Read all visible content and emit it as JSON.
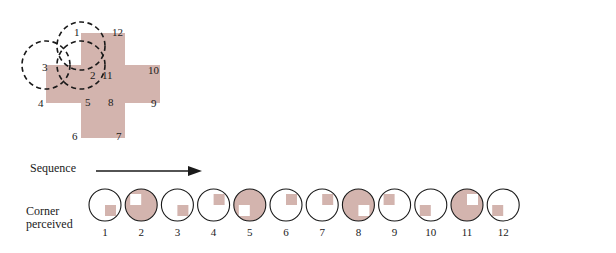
{
  "figure": {
    "kind": "corner-perception-diagram",
    "fill_color": "#d3b4ae",
    "stroke_color": "#1a1a1a",
    "background": "#ffffff"
  },
  "cross": {
    "name": "cross-polygon",
    "vertex_labels": [
      "1",
      "2",
      "3",
      "4",
      "5",
      "6",
      "7",
      "8",
      "9",
      "10",
      "11",
      "12"
    ],
    "dashed_circle_labels": [
      "1",
      "2",
      "3"
    ],
    "vertex_label_positions": [
      {
        "label": "1",
        "x": 74,
        "y": 26
      },
      {
        "label": "2",
        "x": 90,
        "y": 69
      },
      {
        "label": "3",
        "x": 42,
        "y": 61
      },
      {
        "label": "4",
        "x": 38,
        "y": 97
      },
      {
        "label": "5",
        "x": 85,
        "y": 96
      },
      {
        "label": "6",
        "x": 72,
        "y": 130
      },
      {
        "label": "7",
        "x": 116,
        "y": 130
      },
      {
        "label": "8",
        "x": 108,
        "y": 96
      },
      {
        "label": "9",
        "x": 151,
        "y": 97
      },
      {
        "label": "10",
        "x": 148,
        "y": 64
      },
      {
        "label": "11",
        "x": 102,
        "y": 69
      },
      {
        "label": "12",
        "x": 112,
        "y": 26
      }
    ]
  },
  "sequence": {
    "arrow_label": "Sequence",
    "row_label_line1": "Corner",
    "row_label_line2": "perceived",
    "item_labels": [
      "1",
      "2",
      "3",
      "4",
      "5",
      "6",
      "7",
      "8",
      "9",
      "10",
      "11",
      "12"
    ],
    "items": [
      {
        "index": "1",
        "circle_fill": "white",
        "patch_fill": "color",
        "patch_quadrant": "bottom-right"
      },
      {
        "index": "2",
        "circle_fill": "color",
        "patch_fill": "white",
        "patch_quadrant": "top-left"
      },
      {
        "index": "3",
        "circle_fill": "white",
        "patch_fill": "color",
        "patch_quadrant": "bottom-right"
      },
      {
        "index": "4",
        "circle_fill": "white",
        "patch_fill": "color",
        "patch_quadrant": "top-right"
      },
      {
        "index": "5",
        "circle_fill": "color",
        "patch_fill": "white",
        "patch_quadrant": "bottom-left"
      },
      {
        "index": "6",
        "circle_fill": "white",
        "patch_fill": "color",
        "patch_quadrant": "top-right"
      },
      {
        "index": "7",
        "circle_fill": "white",
        "patch_fill": "color",
        "patch_quadrant": "top-right"
      },
      {
        "index": "8",
        "circle_fill": "color",
        "patch_fill": "white",
        "patch_quadrant": "bottom-right"
      },
      {
        "index": "9",
        "circle_fill": "white",
        "patch_fill": "color",
        "patch_quadrant": "top-left"
      },
      {
        "index": "10",
        "circle_fill": "white",
        "patch_fill": "color",
        "patch_quadrant": "bottom-left"
      },
      {
        "index": "11",
        "circle_fill": "color",
        "patch_fill": "white",
        "patch_quadrant": "top-right"
      },
      {
        "index": "12",
        "circle_fill": "white",
        "patch_fill": "color",
        "patch_quadrant": "bottom-left"
      }
    ]
  }
}
